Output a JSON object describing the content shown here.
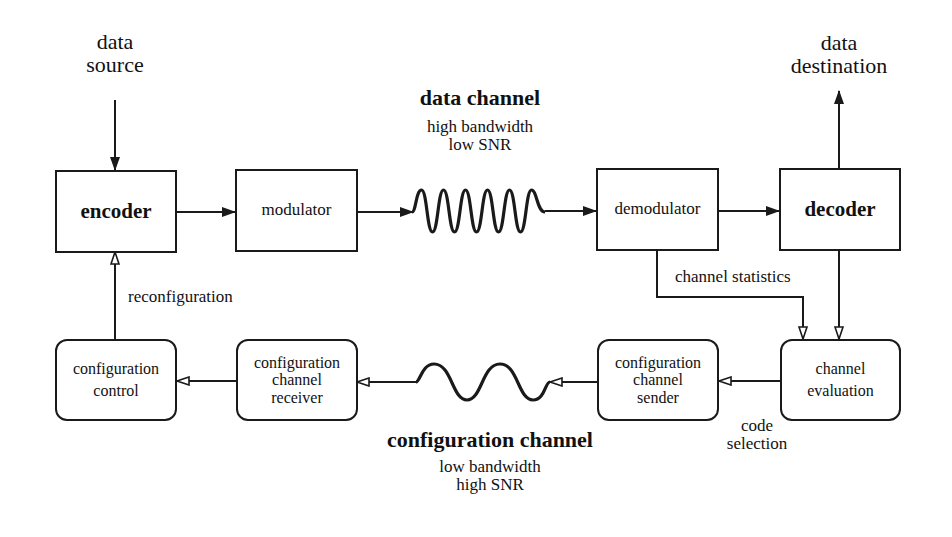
{
  "labels": {
    "data_source": "data\nsource",
    "data_destination": "data\ndestination",
    "data_channel_title": "data channel",
    "data_channel_sub": "high bandwidth\nlow SNR",
    "config_channel_title": "configuration channel",
    "config_channel_sub": "low bandwidth\nhigh SNR",
    "reconfiguration": "reconfiguration",
    "channel_statistics": "channel statistics",
    "code_selection": "code\nselection"
  },
  "blocks": {
    "encoder": "encoder",
    "modulator": "modulator",
    "demodulator": "demodulator",
    "decoder": "decoder",
    "configuration_control": "configuration\ncontrol",
    "configuration_channel_receiver": "configuration\nchannel\nreceiver",
    "configuration_channel_sender": "configuration\nchannel\nsender",
    "channel_evaluation": "channel\nevaluation"
  },
  "colors": {
    "stroke": "#1a1a1a",
    "background": "#ffffff"
  }
}
